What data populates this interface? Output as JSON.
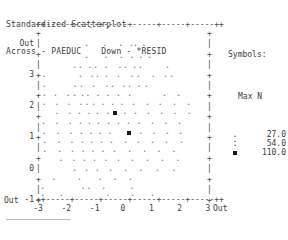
{
  "header": {
    "title": "Standardized Scatterplot",
    "across_label": "Across - PAEDUC",
    "down_label": "Down - *RESID"
  },
  "legend": {
    "title": "Symbols:",
    "max_n_label": "Max N",
    "entries": [
      {
        "symbol": ".",
        "symbol_name": "dot-symbol",
        "value": "27.0"
      },
      {
        "symbol": ":",
        "symbol_name": "colon-symbol",
        "value": "54.0"
      },
      {
        "symbol": "▪",
        "symbol_name": "block-symbol",
        "value": "110.0"
      }
    ]
  },
  "axes": {
    "top_rail": "++-----+-----+-----+-----+-----+-----++",
    "bottom_rail": "++-----+-----+-----+-----+-----+-----++",
    "left_rail": "+\n|\n+\n|\n+\n|\n+\n|\n+\n|\n+\n|\n+\n|\n+\n|\n+",
    "right_rail": "+\n|\n+\n|\n+\n|\n+\n|\n+\n|\n+\n|\n+\n|\n+\n|\n+",
    "y_ticks": [
      "Out",
      "3",
      "2",
      "1",
      "0",
      "-1",
      "-2",
      "-3",
      "Out"
    ],
    "x_ticks": [
      "-3",
      "-2",
      "-1",
      "0",
      "1",
      "2",
      "3"
    ],
    "x_out_left": "Out",
    "x_out_right": "Out",
    "x_label_positions": [
      68,
      103,
      137,
      171,
      183,
      189,
      207
    ]
  },
  "chart_data": {
    "type": "scatter",
    "title": "Standardized Scatterplot",
    "xlabel": "PAEDUC",
    "ylabel": "*RESID",
    "xlim": [
      -3,
      3
    ],
    "ylim": [
      -3,
      3
    ],
    "grid": false,
    "legend_position": "right",
    "symbol_scale": [
      {
        "symbol": ".",
        "max_n": 27.0
      },
      {
        "symbol": ":",
        "max_n": 54.0
      },
      {
        "symbol": "▪",
        "max_n": 110.0
      }
    ],
    "points": [
      {
        "x": -1.15,
        "y": 3.05,
        "s": 0
      },
      {
        "x": -0.55,
        "y": 3.05,
        "s": 0
      },
      {
        "x": -1.3,
        "y": 2.4,
        "s": 0
      },
      {
        "x": -0.65,
        "y": 2.4,
        "s": 0
      },
      {
        "x": -0.1,
        "y": 2.4,
        "s": 0
      },
      {
        "x": 0.28,
        "y": 2.4,
        "s": 0
      },
      {
        "x": 0.42,
        "y": 2.4,
        "s": 0
      },
      {
        "x": 0.72,
        "y": 2.4,
        "s": 0
      },
      {
        "x": -1.3,
        "y": 1.95,
        "s": 0
      },
      {
        "x": -0.62,
        "y": 1.95,
        "s": 0
      },
      {
        "x": -0.08,
        "y": 1.95,
        "s": 0
      },
      {
        "x": 0.3,
        "y": 1.95,
        "s": 0
      },
      {
        "x": 0.62,
        "y": 1.95,
        "s": 0
      },
      {
        "x": 0.92,
        "y": 1.95,
        "s": 0
      },
      {
        "x": -1.72,
        "y": 1.6,
        "s": 0
      },
      {
        "x": -1.52,
        "y": 1.6,
        "s": 0
      },
      {
        "x": -1.18,
        "y": 1.6,
        "s": 0
      },
      {
        "x": -0.98,
        "y": 1.6,
        "s": 0
      },
      {
        "x": -0.62,
        "y": 1.6,
        "s": 0
      },
      {
        "x": -0.12,
        "y": 1.6,
        "s": 0
      },
      {
        "x": 0.08,
        "y": 1.6,
        "s": 0
      },
      {
        "x": 0.4,
        "y": 1.6,
        "s": 0
      },
      {
        "x": 0.6,
        "y": 1.6,
        "s": 0
      },
      {
        "x": 1.55,
        "y": 1.6,
        "s": 0
      },
      {
        "x": -2.8,
        "y": 1.25,
        "s": 0
      },
      {
        "x": -1.52,
        "y": 1.25,
        "s": 0
      },
      {
        "x": -1.1,
        "y": 1.25,
        "s": 0
      },
      {
        "x": -0.92,
        "y": 1.25,
        "s": 0
      },
      {
        "x": -0.6,
        "y": 1.25,
        "s": 0
      },
      {
        "x": -0.18,
        "y": 1.25,
        "s": 0
      },
      {
        "x": 0.3,
        "y": 1.25,
        "s": 0
      },
      {
        "x": 0.52,
        "y": 1.25,
        "s": 0
      },
      {
        "x": 1.05,
        "y": 1.25,
        "s": 0
      },
      {
        "x": 1.48,
        "y": 1.25,
        "s": 0
      },
      {
        "x": 1.7,
        "y": 1.25,
        "s": 0
      },
      {
        "x": -2.8,
        "y": 0.92,
        "s": 0
      },
      {
        "x": -1.7,
        "y": 0.92,
        "s": 0
      },
      {
        "x": -1.48,
        "y": 0.92,
        "s": 0
      },
      {
        "x": -1.05,
        "y": 0.92,
        "s": 0
      },
      {
        "x": -0.58,
        "y": 0.92,
        "s": 0
      },
      {
        "x": -0.38,
        "y": 0.92,
        "s": 0
      },
      {
        "x": 0.02,
        "y": 0.92,
        "s": 0
      },
      {
        "x": 0.22,
        "y": 0.92,
        "s": 0
      },
      {
        "x": 0.55,
        "y": 0.92,
        "s": 0
      },
      {
        "x": 0.8,
        "y": 0.92,
        "s": 0
      },
      {
        "x": -2.8,
        "y": 0.58,
        "s": 0
      },
      {
        "x": -2.4,
        "y": 0.58,
        "s": 0
      },
      {
        "x": -1.95,
        "y": 0.58,
        "s": 0
      },
      {
        "x": -1.72,
        "y": 0.58,
        "s": 0
      },
      {
        "x": -1.45,
        "y": 0.58,
        "s": 0
      },
      {
        "x": -1.25,
        "y": 0.58,
        "s": 0
      },
      {
        "x": -0.9,
        "y": 0.58,
        "s": 0
      },
      {
        "x": -0.55,
        "y": 0.58,
        "s": 0
      },
      {
        "x": -0.18,
        "y": 0.58,
        "s": 0
      },
      {
        "x": 0.22,
        "y": 0.58,
        "s": 0
      },
      {
        "x": 1.45,
        "y": 0.58,
        "s": 0
      },
      {
        "x": 1.95,
        "y": 0.58,
        "s": 0
      },
      {
        "x": -2.8,
        "y": 0.25,
        "s": 0
      },
      {
        "x": -2.35,
        "y": 0.25,
        "s": 0
      },
      {
        "x": -1.92,
        "y": 0.25,
        "s": 0
      },
      {
        "x": -1.5,
        "y": 0.25,
        "s": 0
      },
      {
        "x": -1.28,
        "y": 0.25,
        "s": 0
      },
      {
        "x": -1.05,
        "y": 0.25,
        "s": 0
      },
      {
        "x": -0.72,
        "y": 0.25,
        "s": 0
      },
      {
        "x": -0.38,
        "y": 0.25,
        "s": 0
      },
      {
        "x": -0.05,
        "y": 0.25,
        "s": 0
      },
      {
        "x": 0.35,
        "y": 0.25,
        "s": 0
      },
      {
        "x": 0.85,
        "y": 0.25,
        "s": 0
      },
      {
        "x": 1.3,
        "y": 0.25,
        "s": 0
      },
      {
        "x": 1.8,
        "y": 0.25,
        "s": 0
      },
      {
        "x": 2.3,
        "y": 0.25,
        "s": 0
      },
      {
        "x": -2.35,
        "y": -0.08,
        "s": 0
      },
      {
        "x": -1.9,
        "y": -0.08,
        "s": 0
      },
      {
        "x": -1.55,
        "y": -0.08,
        "s": 0
      },
      {
        "x": -1.22,
        "y": -0.08,
        "s": 0
      },
      {
        "x": -0.92,
        "y": -0.08,
        "s": 0
      },
      {
        "x": -0.55,
        "y": -0.08,
        "s": 0
      },
      {
        "x": -0.28,
        "y": -0.08,
        "s": 2
      },
      {
        "x": 0.05,
        "y": -0.08,
        "s": 0
      },
      {
        "x": 0.42,
        "y": -0.08,
        "s": 0
      },
      {
        "x": 0.88,
        "y": -0.08,
        "s": 0
      },
      {
        "x": 1.35,
        "y": -0.08,
        "s": 0
      },
      {
        "x": 1.82,
        "y": -0.08,
        "s": 0
      },
      {
        "x": 2.32,
        "y": -0.08,
        "s": 0
      },
      {
        "x": -2.82,
        "y": -0.42,
        "s": 0
      },
      {
        "x": -2.35,
        "y": -0.42,
        "s": 0
      },
      {
        "x": -1.88,
        "y": -0.42,
        "s": 0
      },
      {
        "x": -1.52,
        "y": -0.42,
        "s": 0
      },
      {
        "x": -1.2,
        "y": -0.42,
        "s": 0
      },
      {
        "x": -0.88,
        "y": -0.42,
        "s": 0
      },
      {
        "x": -0.52,
        "y": -0.42,
        "s": 0
      },
      {
        "x": -0.18,
        "y": -0.42,
        "s": 0
      },
      {
        "x": 0.18,
        "y": -0.42,
        "s": 0
      },
      {
        "x": 0.55,
        "y": -0.42,
        "s": 0
      },
      {
        "x": 1.02,
        "y": -0.42,
        "s": 0
      },
      {
        "x": 1.5,
        "y": -0.42,
        "s": 0
      },
      {
        "x": 1.98,
        "y": -0.42,
        "s": 0
      },
      {
        "x": -2.8,
        "y": -0.78,
        "s": 0
      },
      {
        "x": -2.3,
        "y": -0.78,
        "s": 0
      },
      {
        "x": -1.85,
        "y": -0.78,
        "s": 0
      },
      {
        "x": -1.48,
        "y": -0.78,
        "s": 0
      },
      {
        "x": -1.15,
        "y": -0.78,
        "s": 0
      },
      {
        "x": -0.82,
        "y": -0.78,
        "s": 0
      },
      {
        "x": -0.48,
        "y": -0.78,
        "s": 0
      },
      {
        "x": 0.22,
        "y": -0.78,
        "s": 2
      },
      {
        "x": 0.62,
        "y": -0.78,
        "s": 0
      },
      {
        "x": 1.08,
        "y": -0.78,
        "s": 0
      },
      {
        "x": 1.55,
        "y": -0.78,
        "s": 0
      },
      {
        "x": 2.02,
        "y": -0.78,
        "s": 0
      },
      {
        "x": -2.78,
        "y": -1.12,
        "s": 0
      },
      {
        "x": -2.28,
        "y": -1.12,
        "s": 0
      },
      {
        "x": -1.82,
        "y": -1.12,
        "s": 0
      },
      {
        "x": -1.45,
        "y": -1.12,
        "s": 0
      },
      {
        "x": -1.12,
        "y": -1.12,
        "s": 0
      },
      {
        "x": -0.78,
        "y": -1.12,
        "s": 0
      },
      {
        "x": -0.42,
        "y": -1.12,
        "s": 0
      },
      {
        "x": 0.08,
        "y": -1.12,
        "s": 0
      },
      {
        "x": 0.52,
        "y": -1.12,
        "s": 0
      },
      {
        "x": 1.02,
        "y": -1.12,
        "s": 0
      },
      {
        "x": 1.52,
        "y": -1.12,
        "s": 0
      },
      {
        "x": 2.05,
        "y": -1.12,
        "s": 0
      },
      {
        "x": -2.78,
        "y": -1.45,
        "s": 0
      },
      {
        "x": -2.25,
        "y": -1.45,
        "s": 0
      },
      {
        "x": -1.8,
        "y": -1.45,
        "s": 0
      },
      {
        "x": -1.42,
        "y": -1.45,
        "s": 0
      },
      {
        "x": -1.08,
        "y": -1.45,
        "s": 0
      },
      {
        "x": -0.72,
        "y": -1.45,
        "s": 0
      },
      {
        "x": -0.32,
        "y": -1.45,
        "s": 0
      },
      {
        "x": 0.22,
        "y": -1.45,
        "s": 0
      },
      {
        "x": 0.75,
        "y": -1.45,
        "s": 0
      },
      {
        "x": 1.25,
        "y": -1.45,
        "s": 0
      },
      {
        "x": 1.78,
        "y": -1.45,
        "s": 0
      },
      {
        "x": -2.2,
        "y": -1.78,
        "s": 0
      },
      {
        "x": -1.75,
        "y": -1.78,
        "s": 0
      },
      {
        "x": -1.38,
        "y": -1.78,
        "s": 0
      },
      {
        "x": -1.02,
        "y": -1.78,
        "s": 0
      },
      {
        "x": -0.62,
        "y": -1.78,
        "s": 0
      },
      {
        "x": -0.18,
        "y": -1.78,
        "s": 0
      },
      {
        "x": 0.32,
        "y": -1.78,
        "s": 0
      },
      {
        "x": 0.85,
        "y": -1.78,
        "s": 0
      },
      {
        "x": 1.38,
        "y": -1.78,
        "s": 0
      },
      {
        "x": 1.92,
        "y": -1.78,
        "s": 0
      },
      {
        "x": -1.72,
        "y": -2.12,
        "s": 0
      },
      {
        "x": -1.3,
        "y": -2.12,
        "s": 0
      },
      {
        "x": -0.92,
        "y": -2.12,
        "s": 0
      },
      {
        "x": -0.45,
        "y": -2.12,
        "s": 0
      },
      {
        "x": 0.08,
        "y": -2.12,
        "s": 0
      },
      {
        "x": 0.62,
        "y": -2.12,
        "s": 0
      },
      {
        "x": 1.2,
        "y": -2.12,
        "s": 0
      },
      {
        "x": 1.78,
        "y": -2.12,
        "s": 0
      },
      {
        "x": -2.45,
        "y": -2.45,
        "s": 0
      },
      {
        "x": -1.55,
        "y": -2.45,
        "s": 0
      },
      {
        "x": -0.82,
        "y": -2.45,
        "s": 0
      },
      {
        "x": -0.3,
        "y": -2.45,
        "s": 0
      },
      {
        "x": 0.25,
        "y": -2.45,
        "s": 0
      },
      {
        "x": -2.85,
        "y": -2.8,
        "s": 0
      },
      {
        "x": -1.42,
        "y": -2.8,
        "s": 0
      },
      {
        "x": -1.22,
        "y": -2.8,
        "s": 0
      },
      {
        "x": -0.7,
        "y": -2.8,
        "s": 0
      },
      {
        "x": 0.3,
        "y": -2.8,
        "s": 0
      },
      {
        "x": -2.85,
        "y": -3.05,
        "s": 0
      },
      {
        "x": -2.2,
        "y": -3.05,
        "s": 0
      },
      {
        "x": -0.55,
        "y": -3.05,
        "s": 0
      },
      {
        "x": 0.32,
        "y": -3.05,
        "s": 0
      },
      {
        "x": 1.02,
        "y": -3.05,
        "s": 0
      }
    ]
  }
}
